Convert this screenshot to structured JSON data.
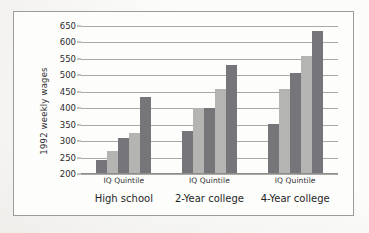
{
  "chart_data": {
    "type": "bar",
    "title": "",
    "subtitle": "",
    "xlabel": "IQ Quintile",
    "ylabel": "1992 weekly wages",
    "ylim": [
      200,
      650
    ],
    "ytick_values": [
      200,
      250,
      300,
      350,
      400,
      450,
      500,
      550,
      600,
      650
    ],
    "ytick_labels": [
      "200",
      "250",
      "300",
      "350",
      "400",
      "450",
      "500",
      "550",
      "600",
      "650"
    ],
    "grid": true,
    "legend": "none",
    "legend_position": "none",
    "categories": [
      "High school",
      "2-Year college",
      "4-Year college"
    ],
    "group_axis_label": "IQ Quintile",
    "series": [
      {
        "name": "1st quintile",
        "values": [
          243,
          330,
          352
        ],
        "color": "#76767a"
      },
      {
        "name": "2nd quintile",
        "values": [
          270,
          400,
          460
        ],
        "color": "#b4b4b2"
      },
      {
        "name": "3rd quintile",
        "values": [
          310,
          400,
          508
        ],
        "color": "#76767a"
      },
      {
        "name": "4th quintile",
        "values": [
          325,
          458,
          560
        ],
        "color": "#b4b4b2"
      },
      {
        "name": "5th quintile",
        "values": [
          435,
          532,
          634
        ],
        "color": "#76767a"
      }
    ],
    "annotations": []
  },
  "axis": {
    "y_title": "1992 weekly wages",
    "ticks": [
      "650",
      "600",
      "550",
      "500",
      "450",
      "400",
      "350",
      "300",
      "250",
      "200"
    ]
  },
  "groups": [
    {
      "quintile_label": "IQ Quintile",
      "category_label": "High school"
    },
    {
      "quintile_label": "IQ Quintile",
      "category_label": "2-Year college"
    },
    {
      "quintile_label": "IQ Quintile",
      "category_label": "4-Year college"
    }
  ],
  "colors": {
    "bar_dark": "#76767a",
    "bar_light": "#b4b4b2",
    "gridline": "#a9a9a5",
    "frame": "#9b9b97",
    "page": "#fcfcfb",
    "text": "#2b2b2b"
  }
}
